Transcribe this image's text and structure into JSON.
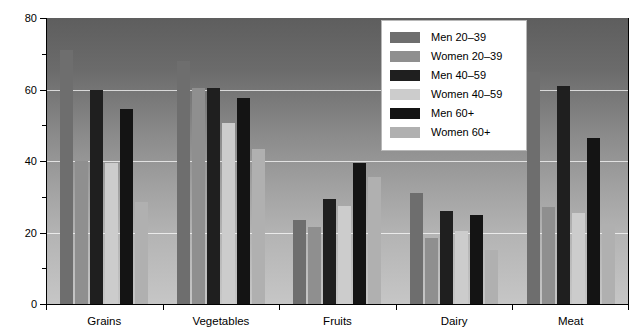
{
  "chart_data": {
    "type": "bar",
    "title": "",
    "xlabel": "",
    "ylabel": "",
    "ylim": [
      0,
      80
    ],
    "y_ticks_major": [
      0,
      20,
      40,
      60,
      80
    ],
    "y_ticks_minor": [
      10,
      30,
      50,
      70
    ],
    "grid": true,
    "grid_orientation": "horizontal",
    "legend_position": "top-right-inside",
    "categories": [
      "Grains",
      "Vegetables",
      "Fruits",
      "Dairy",
      "Meat"
    ],
    "series": [
      {
        "name": "Men 20–39",
        "color": "#6e6e6e",
        "values": [
          71.0,
          68.0,
          23.5,
          31.0,
          65.0
        ]
      },
      {
        "name": "Women 20–39",
        "color": "#8f8f8f",
        "values": [
          40.0,
          60.5,
          21.5,
          18.5,
          27.0
        ]
      },
      {
        "name": "Men 40–59",
        "color": "#1f1f1f",
        "values": [
          60.0,
          60.5,
          29.5,
          26.0,
          61.0
        ]
      },
      {
        "name": "Women 40–59",
        "color": "#cccccc",
        "values": [
          39.5,
          50.5,
          27.5,
          20.5,
          25.5
        ]
      },
      {
        "name": "Men 60+",
        "color": "#141414",
        "values": [
          54.5,
          57.5,
          39.5,
          25.0,
          46.5
        ]
      },
      {
        "name": "Women 60+",
        "color": "#b0b0b0",
        "values": [
          28.5,
          43.5,
          35.5,
          15.0,
          22.5
        ]
      }
    ]
  },
  "axis": {
    "y_labels": [
      "80",
      "60",
      "40",
      "20",
      "0"
    ]
  },
  "colors": {
    "plot_bg_top": "#5e5e5e",
    "plot_bg_bottom": "#c6c6c6",
    "gridline": "#ffffff",
    "axis": "#000000",
    "legend_bg": "#ffffff",
    "legend_border": "#b8b8b8"
  }
}
